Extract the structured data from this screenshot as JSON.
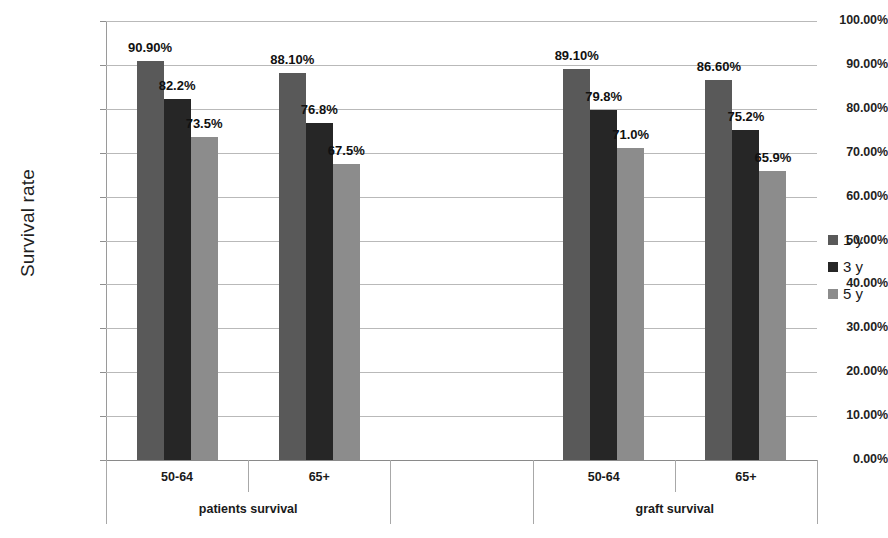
{
  "chart_data": {
    "type": "bar",
    "title": "",
    "xlabel": "",
    "ylabel": "Survival rate",
    "ylim": [
      0,
      100
    ],
    "grid": true,
    "legend_position": "right",
    "ytick_labels": [
      "100.00%",
      "90.00%",
      "80.00%",
      "70.00%",
      "60.00%",
      "50.00%",
      "40.00%",
      "30.00%",
      "20.00%",
      "10.00%",
      "0.00%"
    ],
    "ytick_values": [
      100,
      90,
      80,
      70,
      60,
      50,
      40,
      30,
      20,
      10,
      0
    ],
    "groups": [
      {
        "name": "patients survival",
        "categories": [
          "50-64",
          "65+"
        ]
      },
      {
        "name": "graft survival",
        "categories": [
          "50-64",
          "65+"
        ]
      }
    ],
    "categories": [
      "50-64",
      "65+",
      "50-64",
      "65+"
    ],
    "series": [
      {
        "name": "1 y",
        "color": "#595959",
        "values": [
          90.9,
          88.1,
          89.1,
          86.6
        ],
        "labels": [
          "90.90%",
          "88.10%",
          "89.10%",
          "86.60%"
        ]
      },
      {
        "name": "3 y",
        "color": "#262626",
        "values": [
          82.2,
          76.8,
          79.8,
          75.2
        ],
        "labels": [
          "82.2%",
          "76.8%",
          "79.8%",
          "75.2%"
        ]
      },
      {
        "name": "5 y",
        "color": "#8c8c8c",
        "values": [
          73.5,
          67.5,
          71.0,
          65.9
        ],
        "labels": [
          "73.5%",
          "67.5%",
          "71.0%",
          "65.9%"
        ]
      }
    ]
  },
  "legend": {
    "items": [
      {
        "label": "1 y",
        "color": "#595959"
      },
      {
        "label": "3 y",
        "color": "#262626"
      },
      {
        "label": "5 y",
        "color": "#8c8c8c"
      }
    ]
  },
  "axis": {
    "y_title": "Survival rate"
  }
}
